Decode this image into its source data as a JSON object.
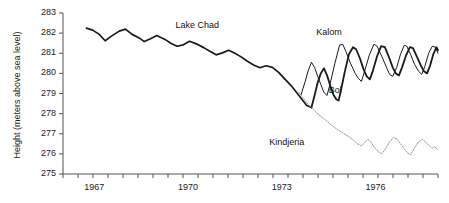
{
  "chart_data": {
    "type": "line",
    "title": "",
    "xlabel": "",
    "ylabel": "Height (meters above sea level)",
    "ylim": [
      275,
      283
    ],
    "xlim": [
      1966.0,
      1978.0
    ],
    "grid": false,
    "legend_position": "inline-annotations",
    "ytick_labels": [
      "283",
      "282",
      "281",
      "280",
      "279",
      "278",
      "277",
      "276",
      "275"
    ],
    "ytick_values": [
      283,
      282,
      281,
      280,
      279,
      278,
      277,
      276,
      275
    ],
    "xtick_labels": [
      "1967",
      "1970",
      "1973",
      "1976"
    ],
    "xtick_values": [
      1967,
      1970,
      1973,
      1976
    ],
    "xtick_minor_count": 25,
    "annotations": [
      {
        "text": "Lake Chad",
        "x": 1969.6,
        "y": 282.35
      },
      {
        "text": "Kalom",
        "x": 1974.1,
        "y": 282.0
      },
      {
        "text": "Bol",
        "x": 1974.5,
        "y": 279.1
      },
      {
        "text": "Kindjeria",
        "x": 1972.6,
        "y": 276.55
      }
    ],
    "series": [
      {
        "name": "Lake Chad",
        "color": "#1a1a1a",
        "width": 1.7,
        "style": "solid",
        "points": [
          [
            1966.75,
            282.25
          ],
          [
            1966.95,
            282.15
          ],
          [
            1967.15,
            281.95
          ],
          [
            1967.35,
            281.62
          ],
          [
            1967.55,
            281.85
          ],
          [
            1967.8,
            282.1
          ],
          [
            1968.0,
            282.2
          ],
          [
            1968.2,
            281.95
          ],
          [
            1968.45,
            281.75
          ],
          [
            1968.6,
            281.58
          ],
          [
            1968.8,
            281.72
          ],
          [
            1969.0,
            281.88
          ],
          [
            1969.25,
            281.7
          ],
          [
            1969.45,
            281.5
          ],
          [
            1969.65,
            281.35
          ],
          [
            1969.85,
            281.42
          ],
          [
            1970.05,
            281.6
          ],
          [
            1970.25,
            281.48
          ],
          [
            1970.5,
            281.28
          ],
          [
            1970.7,
            281.1
          ],
          [
            1970.9,
            280.92
          ],
          [
            1971.1,
            281.02
          ],
          [
            1971.3,
            281.15
          ],
          [
            1971.5,
            281.0
          ],
          [
            1971.7,
            280.82
          ],
          [
            1971.9,
            280.6
          ],
          [
            1972.1,
            280.42
          ],
          [
            1972.3,
            280.28
          ],
          [
            1972.5,
            280.38
          ],
          [
            1972.7,
            280.3
          ],
          [
            1972.9,
            280.05
          ],
          [
            1973.05,
            279.8
          ],
          [
            1973.2,
            279.55
          ],
          [
            1973.35,
            279.3
          ],
          [
            1973.5,
            279.0
          ],
          [
            1973.65,
            278.7
          ],
          [
            1973.8,
            278.4
          ],
          [
            1973.95,
            278.3
          ]
        ]
      },
      {
        "name": "Kalom",
        "color": "#1a1a1a",
        "width": 1.0,
        "style": "solid",
        "points": [
          [
            1973.62,
            278.95
          ],
          [
            1973.75,
            279.6
          ],
          [
            1973.85,
            280.15
          ],
          [
            1973.95,
            280.55
          ],
          [
            1974.05,
            280.3
          ],
          [
            1974.15,
            279.85
          ],
          [
            1974.25,
            279.45
          ],
          [
            1974.35,
            279.05
          ],
          [
            1974.45,
            278.9
          ],
          [
            1974.55,
            279.5
          ],
          [
            1974.7,
            280.5
          ],
          [
            1974.85,
            281.4
          ],
          [
            1974.95,
            281.45
          ],
          [
            1975.05,
            281.1
          ],
          [
            1975.2,
            280.5
          ],
          [
            1975.35,
            280.0
          ],
          [
            1975.45,
            279.75
          ],
          [
            1975.55,
            279.6
          ],
          [
            1975.65,
            280.1
          ],
          [
            1975.8,
            280.9
          ],
          [
            1975.95,
            281.45
          ],
          [
            1976.05,
            281.35
          ],
          [
            1976.2,
            280.85
          ],
          [
            1976.35,
            280.3
          ],
          [
            1976.45,
            279.95
          ],
          [
            1976.55,
            279.85
          ],
          [
            1976.68,
            280.3
          ],
          [
            1976.8,
            280.95
          ],
          [
            1976.92,
            281.4
          ],
          [
            1977.0,
            281.35
          ],
          [
            1977.12,
            280.95
          ],
          [
            1977.25,
            280.45
          ],
          [
            1977.38,
            280.1
          ],
          [
            1977.48,
            279.95
          ],
          [
            1977.58,
            280.35
          ],
          [
            1977.7,
            281.0
          ],
          [
            1977.82,
            281.35
          ],
          [
            1977.92,
            281.3
          ],
          [
            1978.0,
            281.0
          ]
        ]
      },
      {
        "name": "Bol",
        "color": "#1a1a1a",
        "width": 1.8,
        "style": "solid",
        "points": [
          [
            1973.95,
            278.3
          ],
          [
            1974.05,
            278.9
          ],
          [
            1974.15,
            279.55
          ],
          [
            1974.25,
            280.0
          ],
          [
            1974.35,
            280.25
          ],
          [
            1974.45,
            279.9
          ],
          [
            1974.55,
            279.4
          ],
          [
            1974.65,
            278.95
          ],
          [
            1974.75,
            278.7
          ],
          [
            1974.82,
            278.65
          ],
          [
            1974.9,
            279.2
          ],
          [
            1975.02,
            280.1
          ],
          [
            1975.15,
            280.95
          ],
          [
            1975.28,
            281.3
          ],
          [
            1975.38,
            281.2
          ],
          [
            1975.5,
            280.75
          ],
          [
            1975.62,
            280.2
          ],
          [
            1975.72,
            279.85
          ],
          [
            1975.82,
            279.7
          ],
          [
            1975.92,
            280.15
          ],
          [
            1976.05,
            280.85
          ],
          [
            1976.18,
            281.35
          ],
          [
            1976.3,
            281.3
          ],
          [
            1976.42,
            280.85
          ],
          [
            1976.55,
            280.3
          ],
          [
            1976.65,
            280.0
          ],
          [
            1976.75,
            279.9
          ],
          [
            1976.85,
            280.3
          ],
          [
            1976.98,
            280.9
          ],
          [
            1977.1,
            281.3
          ],
          [
            1977.2,
            281.25
          ],
          [
            1977.32,
            280.85
          ],
          [
            1977.45,
            280.4
          ],
          [
            1977.55,
            280.1
          ],
          [
            1977.65,
            280.0
          ],
          [
            1977.75,
            280.4
          ],
          [
            1977.85,
            280.95
          ],
          [
            1977.95,
            281.3
          ],
          [
            1978.0,
            281.15
          ]
        ]
      },
      {
        "name": "Kindjeria",
        "color": "#8a8a8a",
        "width": 0.9,
        "style": "dotted",
        "points": [
          [
            1973.55,
            279.05
          ],
          [
            1973.7,
            278.75
          ],
          [
            1973.85,
            278.45
          ],
          [
            1973.95,
            278.3
          ],
          [
            1974.08,
            278.1
          ],
          [
            1974.2,
            277.92
          ],
          [
            1974.32,
            277.78
          ],
          [
            1974.45,
            277.62
          ],
          [
            1974.58,
            277.45
          ],
          [
            1974.7,
            277.3
          ],
          [
            1974.85,
            277.15
          ],
          [
            1975.0,
            277.0
          ],
          [
            1975.15,
            276.85
          ],
          [
            1975.3,
            276.68
          ],
          [
            1975.42,
            276.5
          ],
          [
            1975.55,
            276.4
          ],
          [
            1975.65,
            276.55
          ],
          [
            1975.75,
            276.72
          ],
          [
            1975.85,
            276.6
          ],
          [
            1975.95,
            276.35
          ],
          [
            1976.08,
            276.15
          ],
          [
            1976.2,
            276.0
          ],
          [
            1976.32,
            276.25
          ],
          [
            1976.45,
            276.6
          ],
          [
            1976.58,
            276.82
          ],
          [
            1976.68,
            276.75
          ],
          [
            1976.8,
            276.5
          ],
          [
            1976.92,
            276.25
          ],
          [
            1977.02,
            276.05
          ],
          [
            1977.12,
            275.95
          ],
          [
            1977.25,
            276.3
          ],
          [
            1977.38,
            276.6
          ],
          [
            1977.5,
            276.72
          ],
          [
            1977.6,
            276.6
          ],
          [
            1977.72,
            276.4
          ],
          [
            1977.82,
            276.28
          ],
          [
            1977.9,
            276.35
          ],
          [
            1977.98,
            276.2
          ]
        ]
      }
    ]
  }
}
